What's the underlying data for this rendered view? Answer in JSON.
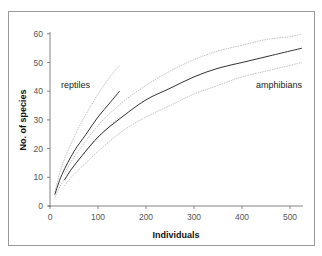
{
  "chart_data": {
    "type": "line",
    "title": "",
    "xlabel": "Individuals",
    "ylabel": "No. of species",
    "xlim": [
      0,
      525
    ],
    "ylim": [
      0,
      60
    ],
    "xticks": [
      0,
      100,
      200,
      300,
      400,
      500
    ],
    "yticks": [
      0,
      10,
      20,
      30,
      40,
      50,
      60
    ],
    "grid": false,
    "legend": "inline labels",
    "series": [
      {
        "name": "reptiles",
        "x": [
          10,
          25,
          50,
          75,
          100,
          125,
          145
        ],
        "values": [
          4,
          11,
          19,
          25,
          31,
          36,
          40
        ],
        "ci_upper": [
          5,
          14,
          24,
          32,
          39,
          45,
          49
        ],
        "ci_lower": [
          3,
          8,
          14,
          19,
          24,
          28,
          31
        ]
      },
      {
        "name": "amphibians",
        "x": [
          30,
          50,
          100,
          150,
          200,
          250,
          300,
          350,
          400,
          450,
          500,
          525
        ],
        "values": [
          9,
          14,
          24,
          31,
          37,
          41,
          45,
          48,
          50,
          52,
          54,
          55
        ],
        "ci_upper": [
          11,
          17,
          28,
          36,
          42,
          47,
          51,
          54,
          56,
          58,
          59,
          60
        ],
        "ci_lower": [
          7,
          11,
          19,
          26,
          31,
          35,
          39,
          42,
          45,
          47,
          49,
          50
        ]
      }
    ]
  },
  "labels": {
    "xlabel": "Individuals",
    "ylabel": "No. of species",
    "reptiles": "reptiles",
    "amphibians": "amphibians",
    "xticks": [
      "0",
      "100",
      "200",
      "300",
      "400",
      "500"
    ],
    "yticks": [
      "0",
      "10",
      "20",
      "30",
      "40",
      "50",
      "60"
    ]
  },
  "colors": {
    "curve": "#333333",
    "ci": "#b0b0b0",
    "axis": "#666666"
  }
}
